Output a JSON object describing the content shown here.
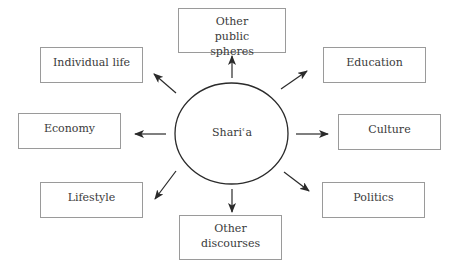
{
  "center": {
    "label": "Shariʿa"
  },
  "nodes": {
    "other_public_spheres": "Other public spheres",
    "individual_life": "Individual life",
    "education": "Education",
    "economy": "Economy",
    "culture": "Culture",
    "lifestyle": "Lifestyle",
    "politics": "Politics",
    "other_discourses": "Other discourses"
  },
  "edges": [
    {
      "from": "Shariʿa",
      "to": "Other public spheres"
    },
    {
      "from": "Shariʿa",
      "to": "Individual life"
    },
    {
      "from": "Shariʿa",
      "to": "Education"
    },
    {
      "from": "Shariʿa",
      "to": "Economy"
    },
    {
      "from": "Shariʿa",
      "to": "Culture"
    },
    {
      "from": "Shariʿa",
      "to": "Lifestyle"
    },
    {
      "from": "Shariʿa",
      "to": "Politics"
    },
    {
      "from": "Shariʿa",
      "to": "Other discourses"
    }
  ]
}
